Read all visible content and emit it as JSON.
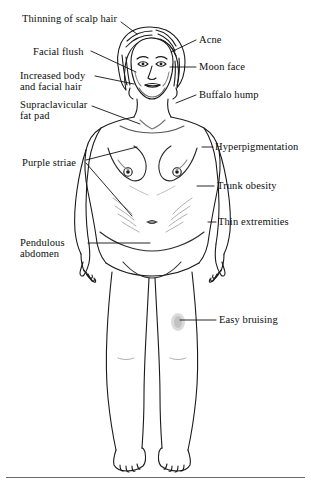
{
  "figure": {
    "text_color": "#0d0d0d",
    "line_color": "#1a1a1a",
    "background": "#ffffff",
    "rule_color": "#6b6b6b"
  },
  "labels": {
    "thinning_scalp_hair": "Thinning of scalp hair",
    "acne": "Acne",
    "facial_flush": "Facial flush",
    "moon_face": "Moon face",
    "increased_body_hair_line1": "Increased body",
    "increased_body_hair_line2": "and facial hair",
    "buffalo_hump": "Buffalo hump",
    "supraclavicular_line1": "Supraclavicular",
    "supraclavicular_line2": "fat pad",
    "hyperpigmentation": "Hyperpigmentation",
    "purple_striae": "Purple striae",
    "trunk_obesity": "Trunk obesity",
    "thin_extremities": "Thin extremities",
    "pendulous_line1": "Pendulous",
    "pendulous_line2": "abdomen",
    "easy_bruising": "Easy bruising"
  }
}
